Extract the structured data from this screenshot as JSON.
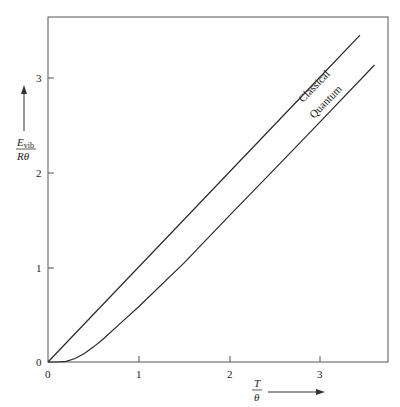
{
  "chart_data": {
    "type": "line",
    "title": "",
    "xlabel": "T/θ",
    "ylabel": "E_vib/Rθ",
    "xlim": [
      0,
      3.75
    ],
    "ylim": [
      0,
      3.65
    ],
    "x_ticks": [
      0,
      1,
      2,
      3
    ],
    "y_ticks": [
      0,
      1,
      2,
      3
    ],
    "grid": false,
    "legend": "inline labels along curves",
    "series": [
      {
        "name": "Classical",
        "x": [
          0,
          0.5,
          1.0,
          1.5,
          2.0,
          2.5,
          3.0,
          3.44
        ],
        "y": [
          0,
          0.5,
          1.0,
          1.5,
          2.0,
          2.5,
          3.0,
          3.44
        ]
      },
      {
        "name": "Quantum",
        "x": [
          0,
          0.1,
          0.2,
          0.3,
          0.4,
          0.5,
          0.6,
          0.8,
          1.0,
          1.5,
          2.0,
          2.5,
          3.0,
          3.6
        ],
        "y": [
          0,
          0.0,
          0.007,
          0.037,
          0.089,
          0.157,
          0.234,
          0.409,
          0.582,
          1.043,
          1.541,
          2.033,
          2.528,
          3.126
        ]
      }
    ]
  },
  "axes": {
    "x_tick_labels": [
      "0",
      "1",
      "2",
      "3"
    ],
    "y_tick_labels": [
      "0",
      "1",
      "2",
      "3"
    ],
    "x_label_num": "T",
    "x_label_den": "θ",
    "y_label_num": "E",
    "y_label_sub": "vib",
    "y_label_den": "Rθ"
  },
  "labels": {
    "classical": "Classical",
    "quantum": "Quantum"
  },
  "colors": {
    "line": "#2a2a2a",
    "frame": "#555555"
  }
}
